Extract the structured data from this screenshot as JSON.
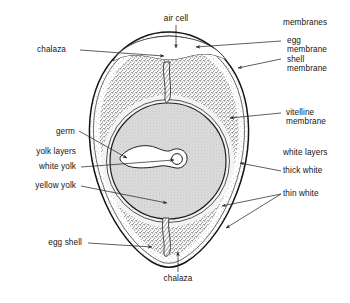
{
  "diagram": {
    "labels": {
      "air_cell": "air cell",
      "chalaza_top": "chalaza",
      "chalaza_bottom": "chalaza",
      "membranes_group": "membranes",
      "egg_membrane_line1": "egg",
      "egg_membrane_line2": "membrane",
      "shell_membrane_line1": "shell",
      "shell_membrane_line2": "membrane",
      "vitelline_line1": "vitelline",
      "vitelline_line2": "membrane",
      "white_layers_group": "white layers",
      "thick_white": "thick white",
      "thin_white": "thin white",
      "germ": "germ",
      "yolk_layers_group": "yolk layers",
      "white_yolk": "white yolk",
      "yellow_yolk": "yellow yolk",
      "egg_shell": "egg shell"
    },
    "colors": {
      "ink": "#141414",
      "outline": "#1a1a1a",
      "yolk_fill": "#d2d2d2",
      "white_fill": "#f2f2f2",
      "stipple": "#555555",
      "background": "#ffffff",
      "leader": "#2b2b2b"
    }
  }
}
